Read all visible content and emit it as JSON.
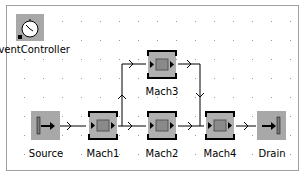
{
  "diagram": {
    "nodes": [
      {
        "id": "event-controller",
        "label": "EventController",
        "icon": "clock-icon"
      },
      {
        "id": "source",
        "label": "Source",
        "icon": "source-icon"
      },
      {
        "id": "mach1",
        "label": "Mach1",
        "icon": "machine-icon"
      },
      {
        "id": "mach2",
        "label": "Mach2",
        "icon": "machine-icon"
      },
      {
        "id": "mach3",
        "label": "Mach3",
        "icon": "machine-icon"
      },
      {
        "id": "mach4",
        "label": "Mach4",
        "icon": "machine-icon"
      },
      {
        "id": "drain",
        "label": "Drain",
        "icon": "drain-icon"
      }
    ],
    "connections": [
      [
        "Source",
        "Mach1"
      ],
      [
        "Mach1",
        "Mach2"
      ],
      [
        "Mach1",
        "Mach3"
      ],
      [
        "Mach2",
        "Mach4"
      ],
      [
        "Mach3",
        "Mach4"
      ],
      [
        "Mach4",
        "Drain"
      ]
    ]
  }
}
